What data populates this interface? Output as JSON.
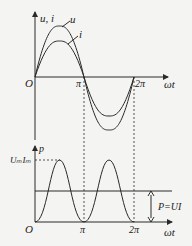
{
  "top_plot": {
    "y_axis_label": "u, i",
    "x_axis_label": "ωt",
    "origin_label": "O",
    "ticks": [
      "π",
      "2π"
    ],
    "curves": [
      {
        "name": "u",
        "label": "u",
        "amplitude": 1.0
      },
      {
        "name": "i",
        "label": "i",
        "amplitude": 0.7
      }
    ]
  },
  "bottom_plot": {
    "y_axis_label": "p",
    "x_axis_label": "ωt",
    "origin_label": "O",
    "ticks": [
      "π",
      "2π"
    ],
    "peak_label": "UₘIₘ",
    "average_label": "P=UI"
  },
  "colors": {
    "line": "#2a2a2a",
    "background": "#f4f4f2"
  }
}
